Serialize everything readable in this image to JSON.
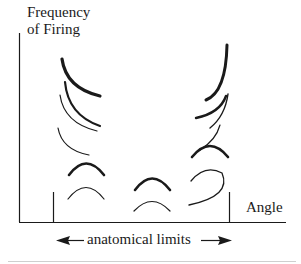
{
  "figure": {
    "y_axis_label_line1": "Frequency",
    "y_axis_label_line2": "of Firing",
    "x_axis_label": "Angle",
    "range_label": "anatomical limits",
    "colors": {
      "ink": "#1a1a1a",
      "background": "#ffffff",
      "separator": "#cfcfcf"
    },
    "curves": [
      {
        "group": "left",
        "shape": "descending-arc",
        "weight": "heavy",
        "position": "top"
      },
      {
        "group": "left",
        "shape": "descending-arc",
        "weight": "medium",
        "position": "upper-middle"
      },
      {
        "group": "left",
        "shape": "descending-arc",
        "weight": "thin",
        "position": "upper-middle"
      },
      {
        "group": "left",
        "shape": "descending-arc",
        "weight": "thin",
        "position": "middle"
      },
      {
        "group": "left",
        "shape": "dome",
        "weight": "heavy",
        "position": "lower"
      },
      {
        "group": "left",
        "shape": "dome",
        "weight": "thin",
        "position": "bottom"
      },
      {
        "group": "center",
        "shape": "dome",
        "weight": "heavy",
        "position": "lower"
      },
      {
        "group": "center",
        "shape": "dome",
        "weight": "thin",
        "position": "bottom"
      },
      {
        "group": "right",
        "shape": "ascending-arc",
        "weight": "heavy",
        "position": "top"
      },
      {
        "group": "right",
        "shape": "ascending-arc",
        "weight": "medium",
        "position": "upper-middle"
      },
      {
        "group": "right",
        "shape": "ascending-arc",
        "weight": "thin",
        "position": "upper-middle"
      },
      {
        "group": "right",
        "shape": "ascending-arc",
        "weight": "thin",
        "position": "middle"
      },
      {
        "group": "right",
        "shape": "dome",
        "weight": "heavy",
        "position": "lower"
      },
      {
        "group": "right",
        "shape": "hook",
        "weight": "thin",
        "position": "bottom"
      }
    ]
  }
}
